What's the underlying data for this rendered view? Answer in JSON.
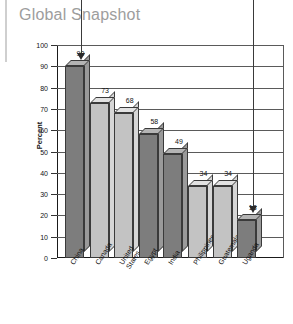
{
  "chart_data": {
    "type": "bar",
    "title": "Global Snapshot",
    "xlabel": "",
    "ylabel": "Percent",
    "ylim": [
      0,
      100
    ],
    "ytick_step": 10,
    "yticks": [
      "100",
      "90",
      "80",
      "70",
      "60",
      "50",
      "40",
      "30",
      "20",
      "10",
      "0"
    ],
    "grid": true,
    "legend": "none",
    "categories": [
      "China",
      "Canada",
      "United States",
      "Egypt",
      "India",
      "Philippines",
      "Guatemala",
      "Uganda"
    ],
    "values": [
      90,
      73,
      68,
      58,
      49,
      34,
      34,
      18
    ],
    "value_labels": [
      "90",
      "73",
      "68",
      "58",
      "49",
      "34",
      "34",
      "18"
    ],
    "bar_styles": [
      "dark",
      "light",
      "light",
      "dark",
      "dark",
      "light",
      "light",
      "dark"
    ],
    "annotations": [
      {
        "name": "arrow-china",
        "target_category": "China",
        "target_value": 90
      },
      {
        "name": "arrow-uganda",
        "target_category": "Uganda",
        "target_value": 18
      }
    ]
  },
  "colors": {
    "title": "#9d9d9d",
    "bar_dark_front": "#7d7d7d",
    "bar_dark_side": "#9a9a9a",
    "bar_dark_top": "#b4b4b4",
    "bar_light_front": "#c3c3c3",
    "bar_light_side": "#d6d6d6",
    "bar_light_top": "#e2e2e2",
    "gridline": "#5a5a5a",
    "axis": "#1a1a1a",
    "background": "#ffffff"
  }
}
